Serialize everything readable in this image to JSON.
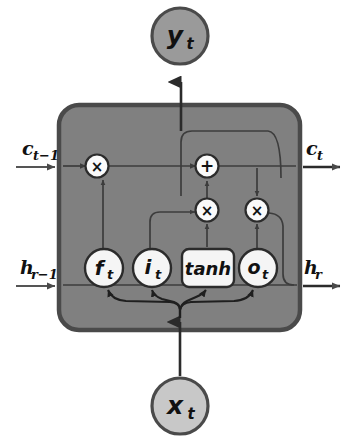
{
  "diagram": {
    "colors": {
      "background": "#ffffff",
      "cell_body_fill": "#808080",
      "cell_body_stroke": "#4a4a4a",
      "gate_fill": "#f5f5f5",
      "gate_stroke": "#2b2b2b",
      "operator_fill": "#fafafa",
      "operator_stroke": "#2b2b2b",
      "io_node_fill_output": "#9a9a9a",
      "io_node_fill_input": "#c8c8c8",
      "io_node_stroke": "#4a4a4a",
      "line_inside": "#3c3c3c",
      "line_outside": "#555555",
      "text": "#111111"
    },
    "inputs": [
      {
        "id": "c-prev",
        "label": "c",
        "sub": "t−1",
        "side": "left",
        "row": "cell-state"
      },
      {
        "id": "h-prev",
        "label": "h",
        "sub": "r−1",
        "side": "left",
        "row": "hidden-state"
      },
      {
        "id": "x-input",
        "label": "x",
        "sub": "t",
        "side": "bottom",
        "row": "input"
      }
    ],
    "outputs": [
      {
        "id": "c-out",
        "label": "c",
        "sub": "t",
        "side": "right",
        "row": "cell-state"
      },
      {
        "id": "h-out",
        "label": "h",
        "sub": "r",
        "side": "right",
        "row": "hidden-state"
      },
      {
        "id": "y-output",
        "label": "y",
        "sub": "t",
        "side": "top",
        "row": "output"
      }
    ],
    "gates": [
      {
        "id": "forget-gate",
        "label": "f",
        "sub": "t",
        "shape": "circle"
      },
      {
        "id": "input-gate",
        "label": "i",
        "sub": "t",
        "shape": "circle"
      },
      {
        "id": "candidate-gate",
        "label": "tanh",
        "sub": "",
        "shape": "rounded-rect"
      },
      {
        "id": "output-gate",
        "label": "o",
        "sub": "t",
        "shape": "circle"
      }
    ],
    "operators": [
      {
        "id": "forget-multiply",
        "symbol": "×",
        "role": "multiply"
      },
      {
        "id": "cell-add",
        "symbol": "+",
        "role": "add"
      },
      {
        "id": "input-multiply",
        "symbol": "×",
        "role": "multiply"
      },
      {
        "id": "output-multiply",
        "symbol": "×",
        "role": "multiply"
      }
    ]
  }
}
